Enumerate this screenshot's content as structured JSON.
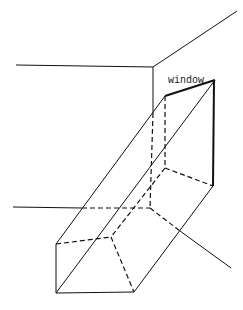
{
  "diagram": {
    "labels": {
      "window": "window"
    }
  }
}
